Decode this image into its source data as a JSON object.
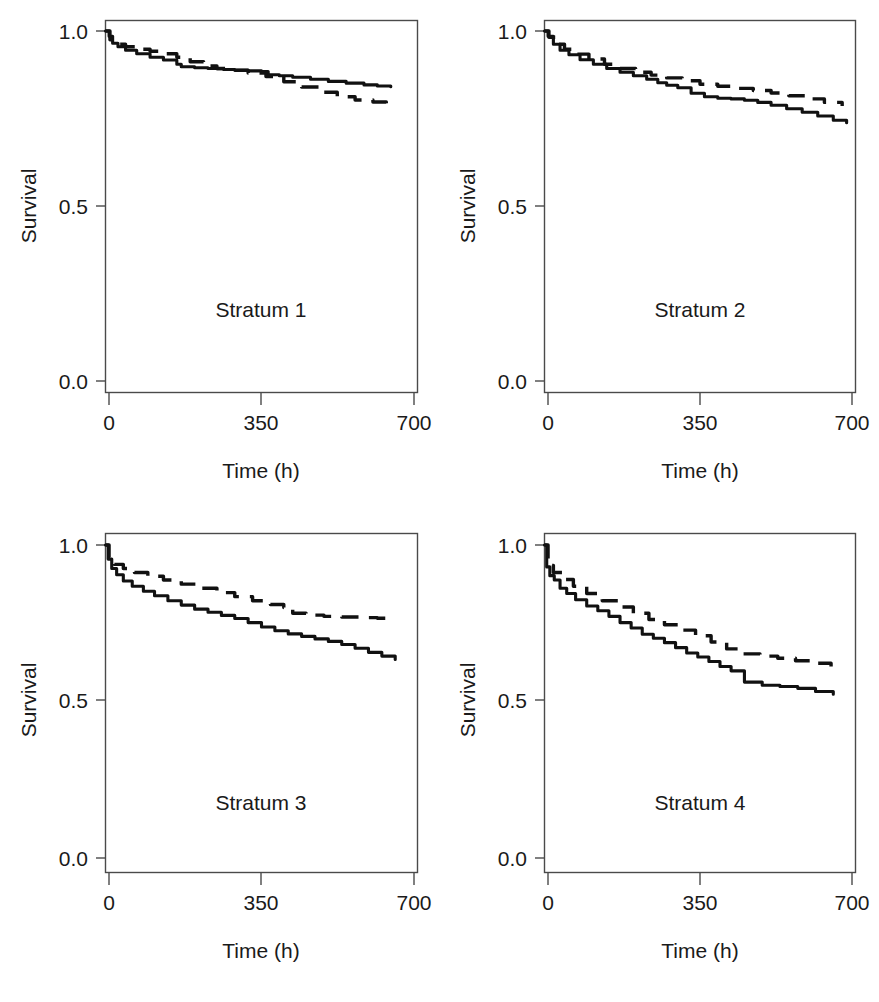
{
  "figure": {
    "background_color": "#ffffff",
    "ink_color": "#111111",
    "axis_color": "#4a4a4a",
    "panel_count": 4,
    "layout": "2x2 grid"
  },
  "cropped_caption_fragment": {
    "visible": true,
    "text": ""
  },
  "axes": {
    "x_title": "Time (h)",
    "y_title": "Survival",
    "x_ticks": [
      "0",
      "350",
      "700"
    ],
    "y_ticks": [
      "0.0",
      "0.5",
      "1.0"
    ]
  },
  "panels": [
    {
      "label": "Stratum 1"
    },
    {
      "label": "Stratum 2"
    },
    {
      "label": "Stratum 3"
    },
    {
      "label": "Stratum 4"
    }
  ],
  "chart_data": [
    {
      "type": "line",
      "title": "Stratum 1",
      "xlabel": "Time (h)",
      "ylabel": "Survival",
      "xlim": [
        0,
        700
      ],
      "ylim": [
        0.0,
        1.0
      ],
      "xticks": [
        0,
        350,
        700
      ],
      "yticks": [
        0.0,
        0.5,
        1.0
      ],
      "grid": false,
      "legend": "none",
      "series": [
        {
          "name": "solid",
          "style": "solid",
          "x": [
            0,
            8,
            16,
            28,
            45,
            70,
            100,
            130,
            160,
            170,
            200,
            230,
            250,
            265,
            290,
            320,
            350,
            365,
            390,
            420,
            460,
            500,
            540,
            580,
            610,
            640
          ],
          "y": [
            1.0,
            0.985,
            0.965,
            0.955,
            0.945,
            0.935,
            0.925,
            0.917,
            0.905,
            0.898,
            0.895,
            0.893,
            0.892,
            0.89,
            0.888,
            0.886,
            0.884,
            0.875,
            0.872,
            0.868,
            0.862,
            0.856,
            0.851,
            0.846,
            0.843,
            0.841
          ]
        },
        {
          "name": "dashed",
          "style": "dashed",
          "x": [
            0,
            10,
            25,
            45,
            70,
            100,
            130,
            160,
            190,
            220,
            250,
            280,
            320,
            360,
            400,
            440,
            480,
            520,
            560,
            600,
            630
          ],
          "y": [
            1.0,
            0.975,
            0.962,
            0.955,
            0.948,
            0.942,
            0.935,
            0.925,
            0.912,
            0.9,
            0.893,
            0.888,
            0.88,
            0.87,
            0.855,
            0.84,
            0.825,
            0.812,
            0.803,
            0.797,
            0.793
          ]
        }
      ]
    },
    {
      "type": "line",
      "title": "Stratum 2",
      "xlabel": "Time (h)",
      "ylabel": "Survival",
      "xlim": [
        0,
        700
      ],
      "ylim": [
        0.0,
        1.0
      ],
      "xticks": [
        0,
        350,
        700
      ],
      "yticks": [
        0.0,
        0.5,
        1.0
      ],
      "grid": false,
      "legend": "none",
      "series": [
        {
          "name": "solid",
          "style": "solid",
          "x": [
            0,
            8,
            20,
            35,
            55,
            80,
            110,
            140,
            170,
            200,
            230,
            255,
            275,
            300,
            330,
            360,
            390,
            420,
            450,
            480,
            510,
            545,
            580,
            615,
            650,
            680
          ],
          "y": [
            1.0,
            0.985,
            0.962,
            0.945,
            0.932,
            0.918,
            0.905,
            0.893,
            0.882,
            0.872,
            0.862,
            0.852,
            0.845,
            0.838,
            0.822,
            0.812,
            0.808,
            0.806,
            0.802,
            0.796,
            0.788,
            0.778,
            0.768,
            0.757,
            0.745,
            0.738
          ]
        },
        {
          "name": "dashed",
          "style": "dashed",
          "x": [
            0,
            10,
            25,
            45,
            70,
            100,
            135,
            170,
            205,
            240,
            275,
            310,
            350,
            390,
            430,
            470,
            510,
            550,
            590,
            630,
            670
          ],
          "y": [
            1.0,
            0.982,
            0.962,
            0.948,
            0.934,
            0.92,
            0.905,
            0.893,
            0.882,
            0.874,
            0.866,
            0.858,
            0.848,
            0.842,
            0.836,
            0.83,
            0.823,
            0.815,
            0.806,
            0.796,
            0.786
          ]
        }
      ]
    },
    {
      "type": "line",
      "title": "Stratum 3",
      "xlabel": "Time (h)",
      "ylabel": "Survival",
      "xlim": [
        0,
        700
      ],
      "ylim": [
        0.0,
        1.0
      ],
      "xticks": [
        0,
        350,
        700
      ],
      "yticks": [
        0.0,
        0.5,
        1.0
      ],
      "grid": false,
      "legend": "none",
      "series": [
        {
          "name": "solid",
          "style": "solid",
          "x": [
            0,
            6,
            14,
            25,
            40,
            60,
            85,
            110,
            140,
            170,
            200,
            230,
            260,
            290,
            320,
            350,
            380,
            410,
            440,
            470,
            500,
            530,
            560,
            590,
            620,
            650
          ],
          "y": [
            1.0,
            0.955,
            0.925,
            0.905,
            0.885,
            0.868,
            0.852,
            0.838,
            0.822,
            0.808,
            0.795,
            0.785,
            0.775,
            0.765,
            0.752,
            0.738,
            0.726,
            0.716,
            0.708,
            0.7,
            0.692,
            0.682,
            0.67,
            0.657,
            0.645,
            0.634
          ]
        },
        {
          "name": "dashed",
          "style": "dashed",
          "x": [
            0,
            8,
            20,
            40,
            65,
            95,
            130,
            170,
            210,
            250,
            290,
            330,
            370,
            400,
            420,
            450,
            490,
            530,
            570,
            610,
            650
          ],
          "y": [
            1.0,
            0.96,
            0.938,
            0.925,
            0.912,
            0.9,
            0.888,
            0.875,
            0.862,
            0.848,
            0.835,
            0.822,
            0.81,
            0.8,
            0.782,
            0.776,
            0.772,
            0.77,
            0.768,
            0.766,
            0.765
          ]
        }
      ]
    },
    {
      "type": "line",
      "title": "Stratum 4",
      "xlabel": "Time (h)",
      "ylabel": "Survival",
      "xlim": [
        0,
        700
      ],
      "ylim": [
        0.0,
        1.0
      ],
      "xticks": [
        0,
        350,
        700
      ],
      "yticks": [
        0.0,
        0.5,
        1.0
      ],
      "grid": false,
      "legend": "none",
      "series": [
        {
          "name": "solid",
          "style": "solid",
          "x": [
            0,
            5,
            12,
            22,
            35,
            50,
            70,
            95,
            120,
            145,
            170,
            195,
            220,
            245,
            270,
            295,
            320,
            345,
            370,
            395,
            420,
            450,
            490,
            530,
            570,
            610,
            650
          ],
          "y": [
            1.0,
            0.93,
            0.902,
            0.888,
            0.862,
            0.845,
            0.825,
            0.805,
            0.79,
            0.772,
            0.752,
            0.735,
            0.715,
            0.702,
            0.688,
            0.672,
            0.655,
            0.642,
            0.628,
            0.612,
            0.598,
            0.562,
            0.552,
            0.548,
            0.542,
            0.532,
            0.523
          ]
        },
        {
          "name": "dashed",
          "style": "dashed",
          "x": [
            0,
            8,
            20,
            40,
            65,
            95,
            130,
            165,
            200,
            235,
            270,
            305,
            340,
            375,
            410,
            445,
            485,
            525,
            565,
            605,
            645
          ],
          "y": [
            1.0,
            0.935,
            0.912,
            0.89,
            0.868,
            0.845,
            0.822,
            0.802,
            0.782,
            0.762,
            0.745,
            0.728,
            0.71,
            0.69,
            0.668,
            0.652,
            0.645,
            0.638,
            0.63,
            0.622,
            0.612
          ]
        }
      ]
    }
  ]
}
